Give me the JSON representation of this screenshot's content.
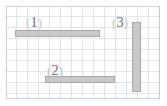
{
  "diagram": {
    "background": "#ffffff",
    "paper": {
      "name": "graph-paper",
      "grid_color": "#cdd6e0",
      "border_color": "#b9c2cc",
      "cell_size_px": 11,
      "columns": 14,
      "rows": 8,
      "x": 6,
      "y": 6,
      "width": 154,
      "height": 93
    },
    "bar_fill_color": "#c9c9c9",
    "bar_stroke_color": "#a8a8a8",
    "label_color": "#6b6b6b",
    "bars": [
      {
        "id": "bar-1",
        "label": "1",
        "open_paren": "(",
        "close_paren": ")",
        "orientation": "horizontal",
        "x": 15,
        "y": 30,
        "width": 85,
        "height": 7,
        "label_x": 26,
        "label_y": 15
      },
      {
        "id": "bar-2",
        "label": "2",
        "open_paren": "(",
        "close_paren": ")",
        "orientation": "horizontal",
        "x": 45,
        "y": 76,
        "width": 70,
        "height": 7,
        "label_x": 47,
        "label_y": 63
      },
      {
        "id": "bar-3",
        "label": "3",
        "open_paren": "(",
        "close_paren": ")",
        "orientation": "vertical",
        "x": 132,
        "y": 22,
        "width": 9,
        "height": 70,
        "label_x": 112,
        "label_y": 15
      }
    ]
  }
}
